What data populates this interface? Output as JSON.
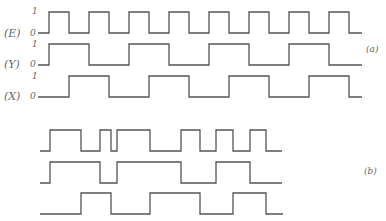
{
  "diagram": {
    "part_a": {
      "label": "(a)",
      "signals": [
        {
          "name": "(E)",
          "level_high": "1",
          "level_low": "0",
          "y_high": 12,
          "y_low": 33,
          "path": "M38,33 H49 V12 H69 V33 H89 V12 H109 V33 H129 V12 H149 V33 H169 V12 H189 V33 H209 V12 H229 V33 H249 V12 H269 V33 H289 V12 H309 V33 H329 V12 H349 V33 H362"
        },
        {
          "name": "(Y)",
          "level_high": "1",
          "level_low": "0",
          "y_high": 44,
          "y_low": 65,
          "path": "M38,65 H49 V44 H89 V65 H129 V44 H169 V65 H209 V44 H249 V65 H289 V44 H329 V65 H362"
        },
        {
          "name": "(X)",
          "level_high": "1",
          "level_low": "0",
          "y_high": 76,
          "y_low": 97,
          "path": "M38,97 H69 V76 H109 V97 H149 V76 H189 V97 H229 V76 H269 V97 H309 V76 H349 V97 H362"
        }
      ]
    },
    "part_b": {
      "label": "(b)",
      "signals": [
        {
          "path": "M40,151 H50 V130 H81 V151 H100 V130 H111 V151 H117 V130 H150 V151 H181 V130 H200 V151 H216 V130 H233 V151 H250 V130 H266 V151 H282"
        },
        {
          "path": "M40,183 H50 V162 H100 V183 H117 V162 H181 V183 H216 V162 H250 V183 H282"
        },
        {
          "path": "M40,214 H81 V193 H111 V214 H150 V193 H200 V214 H233 V193 H266 V214 H283"
        }
      ]
    }
  }
}
